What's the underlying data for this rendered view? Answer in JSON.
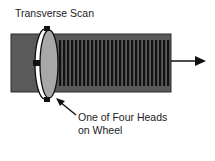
{
  "diagram": {
    "title": "Transverse Scan",
    "caption_line1": "One of Four Heads",
    "caption_line2": "on Wheel",
    "elements": {
      "tape": "magnetic tape",
      "wheel": "rotating head wheel",
      "heads": "recording heads",
      "tracks": "transverse tracks",
      "direction": "tape motion arrow"
    },
    "colors": {
      "tape": "#5a5a5a",
      "tape_border": "#2a2a2a",
      "tracks": "#111111",
      "wheel_disc": "#a8a8a8",
      "wheel_ring": "#ffffff",
      "head": "#111111",
      "arrow": "#111111"
    },
    "track_count": 28
  }
}
